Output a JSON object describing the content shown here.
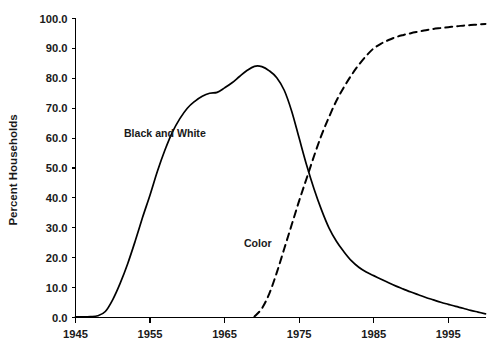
{
  "chart_data": {
    "type": "line",
    "title": "",
    "subtitle": "",
    "xlabel": "",
    "ylabel": "Percent Households",
    "xlim": [
      1945,
      2000
    ],
    "ylim": [
      0.0,
      100.0
    ],
    "grid": false,
    "legend_position": "inline-annotation",
    "x_ticks": [
      "1945",
      "1955",
      "1965",
      "1975",
      "1985",
      "1995"
    ],
    "x_tick_values": [
      1945,
      1955,
      1965,
      1975,
      1985,
      1995
    ],
    "y_ticks": [
      "0.0",
      "10.0",
      "20.0",
      "30.0",
      "40.0",
      "50.0",
      "60.0",
      "70.0",
      "80.0",
      "90.0",
      "100.0"
    ],
    "y_tick_values": [
      0,
      10,
      20,
      30,
      40,
      50,
      60,
      70,
      80,
      90,
      100
    ],
    "x": [
      1945,
      1946,
      1947,
      1948,
      1949,
      1950,
      1951,
      1952,
      1953,
      1954,
      1955,
      1956,
      1957,
      1958,
      1959,
      1960,
      1961,
      1962,
      1963,
      1964,
      1965,
      1966,
      1967,
      1968,
      1969,
      1970,
      1971,
      1972,
      1973,
      1974,
      1975,
      1976,
      1977,
      1978,
      1979,
      1980,
      1981,
      1982,
      1983,
      1984,
      1985,
      1986,
      1987,
      1988,
      1989,
      1990,
      1991,
      1992,
      1993,
      1994,
      1995,
      1996,
      1997,
      1998,
      1999,
      2000
    ],
    "series": [
      {
        "name": "Black and White",
        "style": "solid",
        "color": "#000000",
        "label_x": 1951.5,
        "label_y": 60.5,
        "values": [
          0.2,
          0.2,
          0.3,
          0.6,
          2.0,
          6.0,
          11.5,
          18.0,
          25.5,
          33.5,
          41.0,
          49.0,
          56.0,
          62.0,
          66.5,
          70.0,
          72.3,
          74.0,
          75.0,
          75.3,
          76.8,
          78.5,
          80.6,
          82.6,
          84.0,
          83.9,
          82.5,
          80.2,
          76.0,
          69.0,
          60.0,
          51.0,
          43.0,
          36.0,
          30.0,
          25.5,
          22.0,
          19.0,
          16.8,
          15.2,
          14.0,
          12.8,
          11.6,
          10.5,
          9.5,
          8.5,
          7.6,
          6.7,
          5.9,
          5.1,
          4.4,
          3.7,
          3.1,
          2.4,
          1.8,
          1.2
        ]
      },
      {
        "name": "Color",
        "style": "dashed",
        "color": "#000000",
        "label_x": 1967.6,
        "label_y": 23.5,
        "values": [
          null,
          null,
          null,
          null,
          null,
          null,
          null,
          null,
          null,
          null,
          null,
          null,
          null,
          null,
          null,
          null,
          null,
          null,
          null,
          null,
          null,
          null,
          null,
          null,
          0.3,
          3.0,
          8.0,
          15.0,
          23.0,
          31.0,
          39.0,
          46.5,
          54.0,
          61.0,
          67.0,
          72.5,
          77.0,
          81.0,
          84.5,
          87.5,
          90.0,
          91.6,
          92.8,
          93.8,
          94.5,
          95.1,
          95.6,
          96.1,
          96.5,
          96.8,
          97.1,
          97.4,
          97.6,
          97.8,
          98.0,
          98.2
        ]
      }
    ]
  }
}
